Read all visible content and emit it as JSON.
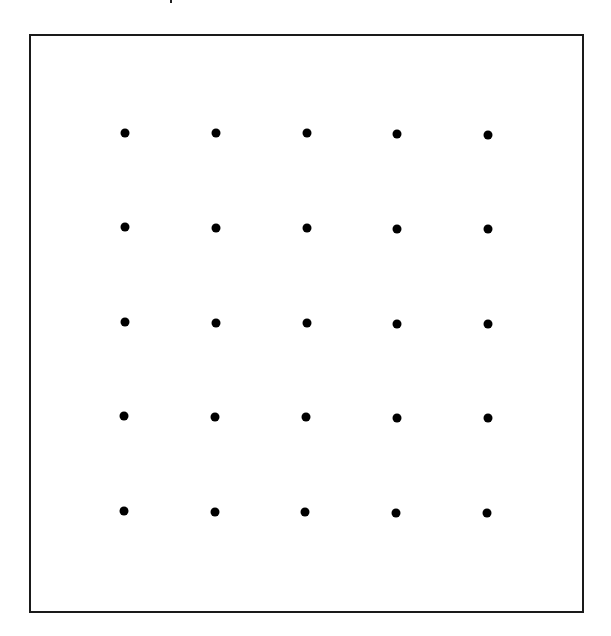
{
  "diagram": {
    "type": "dot-grid",
    "rows": 5,
    "cols": 5,
    "frame": {
      "left": 29,
      "top": 34,
      "right": 583,
      "bottom": 612,
      "stroke": "#1a1a1a"
    },
    "dot_color": "#000000",
    "dot_diameter": 9,
    "dots": [
      [
        {
          "x": 125,
          "y": 133
        },
        {
          "x": 216,
          "y": 133
        },
        {
          "x": 307,
          "y": 133
        },
        {
          "x": 397,
          "y": 134
        },
        {
          "x": 488,
          "y": 135
        }
      ],
      [
        {
          "x": 125,
          "y": 227
        },
        {
          "x": 216,
          "y": 228
        },
        {
          "x": 307,
          "y": 228
        },
        {
          "x": 397,
          "y": 229
        },
        {
          "x": 488,
          "y": 229
        }
      ],
      [
        {
          "x": 125,
          "y": 322
        },
        {
          "x": 216,
          "y": 323
        },
        {
          "x": 307,
          "y": 323
        },
        {
          "x": 397,
          "y": 324
        },
        {
          "x": 488,
          "y": 324
        }
      ],
      [
        {
          "x": 124,
          "y": 416
        },
        {
          "x": 215,
          "y": 417
        },
        {
          "x": 306,
          "y": 417
        },
        {
          "x": 397,
          "y": 418
        },
        {
          "x": 488,
          "y": 418
        }
      ],
      [
        {
          "x": 124,
          "y": 511
        },
        {
          "x": 215,
          "y": 512
        },
        {
          "x": 305,
          "y": 512
        },
        {
          "x": 396,
          "y": 513
        },
        {
          "x": 487,
          "y": 513
        }
      ]
    ]
  }
}
